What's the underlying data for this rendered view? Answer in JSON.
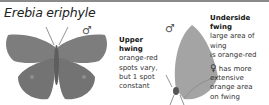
{
  "title": "Erebia eriphyle",
  "upper_figure": {
    "sex_symbol": "♂",
    "heading": "Upper hwing",
    "heading_line1": "Upper",
    "heading_line2": "hwing",
    "text_lines": [
      "orange-red",
      "spots vary,",
      "but 1 spot",
      "constant"
    ]
  },
  "under_figure": {
    "sex_symbol": "♂",
    "heading": "Underside fwing",
    "text_lines": [
      "large area of wing",
      "is orange-red"
    ]
  },
  "female_note": {
    "symbol": "♀",
    "text_lines": [
      "has more",
      "extensive",
      "orange area",
      "on fwing"
    ]
  },
  "colors": {
    "wing_upper": "#7d7d7d",
    "wing_under": "#a4a4a4",
    "rule": "#8a8a8a"
  }
}
